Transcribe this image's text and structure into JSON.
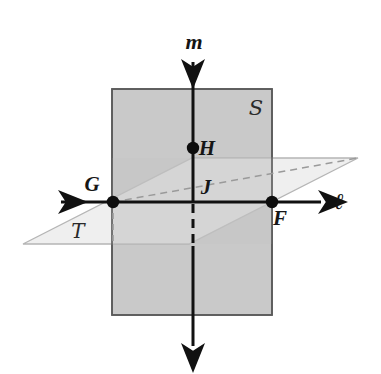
{
  "figure": {
    "background_color": "#ffffff"
  },
  "planes": [
    {
      "id": "plane-s",
      "label": "S",
      "shape": "rectangle",
      "description": "vertical plane drawn as an upright rectangle",
      "fill_color": "#c9c9c9",
      "stroke_color": "#5a5a5a",
      "label_x": 256,
      "label_y": 112,
      "rect": {
        "x": 112,
        "y": 89,
        "width": 160,
        "height": 226
      }
    },
    {
      "id": "plane-t",
      "label": "T",
      "shape": "parallelogram",
      "description": "horizontal plane drawn as a slanted parallelogram",
      "fill_color": "#ececec",
      "stroke_color": "#b5b5b5",
      "label_x": 78,
      "label_y": 236,
      "points": "23,244 189,244 358,158 192,158"
    }
  ],
  "lines": [
    {
      "id": "line-ell",
      "label": "ℓ",
      "description": "horizontal double-headed arrow line through G and F",
      "label_x": 337,
      "label_y": 208,
      "color": "#111111",
      "x1": 57,
      "y1": 202,
      "x2": 325,
      "y2": 202
    },
    {
      "id": "line-m",
      "label": "m",
      "description": "vertical double-headed arrow line through H and J",
      "label_x": 194,
      "label_y": 48,
      "color": "#111111",
      "x1": 193,
      "y1": 58,
      "x2": 193,
      "y2": 350
    }
  ],
  "points": [
    {
      "id": "point-g",
      "label": "G",
      "x": 113,
      "y": 202,
      "label_x": 92,
      "label_y": 191
    },
    {
      "id": "point-f",
      "label": "F",
      "x": 272,
      "y": 202,
      "label_x": 280,
      "label_y": 225
    },
    {
      "id": "point-h",
      "label": "H",
      "x": 193,
      "y": 148,
      "label_x": 204,
      "label_y": 155
    },
    {
      "id": "point-j",
      "label": "J",
      "x": 193,
      "y": 202,
      "label_x": 204,
      "label_y": 194
    }
  ],
  "hidden_edges": [
    {
      "id": "hidden-back-edge",
      "description": "dashed back edge of horizontal plane from G rising to the right",
      "color": "#9a9a9a",
      "x1": 113,
      "y1": 202,
      "x2": 358,
      "y2": 158
    },
    {
      "id": "hidden-drop-g",
      "description": "dashed light vertical drop line from G to near plane bottom edge",
      "color": "#9a9a9a",
      "x1": 113,
      "y1": 202,
      "x2": 113,
      "y2": 244
    },
    {
      "id": "hidden-drop-j",
      "description": "bold dashed vertical segment of line m below J inside plane T",
      "color": "#111111",
      "x1": 193,
      "y1": 202,
      "x2": 193,
      "y2": 244
    }
  ],
  "colors": {
    "plane_s_fill": "#c9c9c9",
    "plane_t_fill": "#ececec",
    "stroke_dark": "#111111",
    "stroke_gray": "#9a9a9a"
  }
}
